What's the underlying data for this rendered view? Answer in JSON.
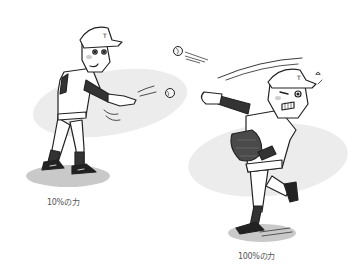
{
  "illustration": {
    "subject": "Two cartoon baseball players comparing throwing effort",
    "colors": {
      "background": "#ffffff",
      "shadow_ellipse": "#e9e9e9",
      "ground_shadow": "#c8c8c8",
      "line": "#222222",
      "dark_fill": "#3a3a3a",
      "skin_blush": "#bdbdbd"
    },
    "figures": [
      {
        "id": "left",
        "description": "Relaxed player tossing a ball lightly underhand",
        "cap_letter": "T",
        "caption": "10%の力"
      },
      {
        "id": "right",
        "description": "Straining player throwing overhand with full force, wearing a glove",
        "cap_letter": "T",
        "caption": "100%の力"
      }
    ],
    "balls": [
      {
        "id": "ball-flying-fast",
        "x": 178,
        "y": 51
      },
      {
        "id": "ball-tossed-soft",
        "x": 170,
        "y": 93
      }
    ]
  }
}
